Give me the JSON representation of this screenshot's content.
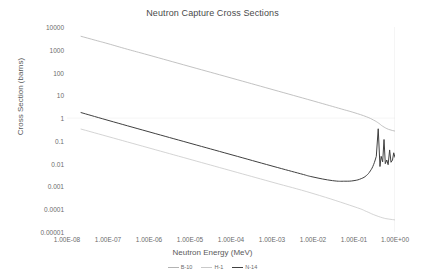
{
  "chart_data": {
    "type": "line",
    "title": "Neutron Capture Cross Sections",
    "xlabel": "Neutron Energy (MeV)",
    "ylabel": "Cross Section (barns)",
    "xscale": "log",
    "yscale": "log",
    "xlim": [
      1e-08,
      1.0
    ],
    "ylim": [
      1e-05,
      10000.0
    ],
    "grid": false,
    "legend_position": "bottom",
    "xticks": [
      "1.00E-08",
      "1.00E-07",
      "1.00E-06",
      "1.00E-05",
      "1.00E-04",
      "1.00E-03",
      "1.00E-02",
      "1.00E-01",
      "1.00E+00"
    ],
    "xtick_values": [
      1e-08,
      1e-07,
      1e-06,
      1e-05,
      0.0001,
      0.001,
      0.01,
      0.1,
      1.0
    ],
    "yticks": [
      "10000",
      "1000",
      "100",
      "10",
      "1",
      "0.1",
      "0.01",
      "0.001",
      "0.0001",
      "0.00001"
    ],
    "ytick_values": [
      10000,
      1000,
      100,
      10,
      1,
      0.1,
      0.01,
      0.001,
      0.0001,
      1e-05
    ],
    "series": [
      {
        "name": "B-10",
        "color": "#b3b3b3",
        "width": 0.8,
        "x": [
          2.2e-08,
          5e-08,
          1e-07,
          3e-07,
          1e-06,
          1e-05,
          0.0001,
          0.001,
          0.01,
          0.05,
          0.1,
          0.2,
          0.3,
          0.4,
          0.5,
          0.7,
          1.0
        ],
        "y": [
          3900,
          2600,
          1850,
          1050,
          580,
          183,
          58,
          18.2,
          5.7,
          2.5,
          1.75,
          1.15,
          0.82,
          0.6,
          0.44,
          0.32,
          0.27
        ]
      },
      {
        "name": "H-1",
        "color": "#c9c9c9",
        "width": 0.8,
        "x": [
          2.2e-08,
          1e-07,
          1e-06,
          1e-05,
          0.0001,
          0.001,
          0.01,
          0.1,
          0.2,
          0.3,
          0.5,
          0.7,
          1.0
        ],
        "y": [
          0.33,
          0.155,
          0.049,
          0.0155,
          0.0049,
          0.00155,
          0.00049,
          0.00013,
          8e-05,
          5.8e-05,
          4.2e-05,
          3.7e-05,
          3.4e-05
        ]
      },
      {
        "name": "N-14",
        "color": "#404040",
        "width": 1.0,
        "x": [
          2.2e-08,
          1e-07,
          1e-06,
          1e-05,
          0.0001,
          0.001,
          0.005,
          0.01,
          0.03,
          0.06,
          0.1,
          0.15,
          0.2,
          0.25,
          0.3,
          0.35,
          0.39,
          0.43,
          0.46,
          0.5,
          0.54,
          0.58,
          0.63,
          0.68,
          0.74,
          0.8,
          0.87,
          0.93,
          1.0
        ],
        "y": [
          1.75,
          0.8,
          0.25,
          0.079,
          0.025,
          0.0079,
          0.0036,
          0.0026,
          0.0018,
          0.0017,
          0.0018,
          0.0022,
          0.003,
          0.0048,
          0.009,
          0.021,
          0.34,
          0.0075,
          0.021,
          0.012,
          0.115,
          0.01,
          0.0145,
          0.009,
          0.04,
          0.0115,
          0.0145,
          0.03,
          0.019
        ]
      }
    ],
    "annotations": {
      "note_resonances": "N-14 shows sharp resonance peaks between 0.4 and 1.0 MeV"
    }
  }
}
